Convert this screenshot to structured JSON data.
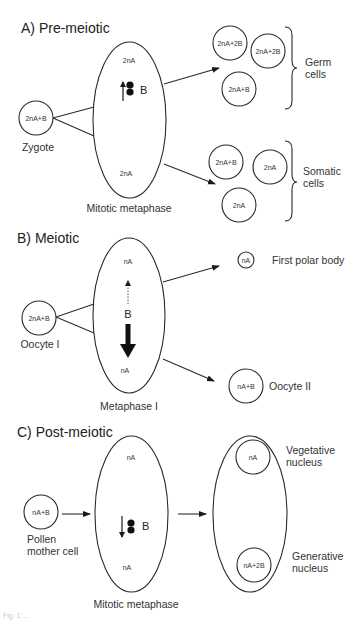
{
  "figure": {
    "sections": [
      {
        "id": "A",
        "title": "A)  Pre-meiotic",
        "start_cell": {
          "content": "2nA+B",
          "label": "Zygote"
        },
        "spindle": {
          "top": "2nA",
          "bottom": "2nA",
          "chromosome": "B",
          "movement": "up",
          "label": "Mitotic metaphase"
        },
        "outcomes": [
          {
            "group": "Germ cells",
            "group_lines": [
              "Germ",
              "cells"
            ],
            "cells": [
              "2nA+2B",
              "2nA+2B",
              "2nA+B"
            ]
          },
          {
            "group": "Somatic cells",
            "group_lines": [
              "Somatic",
              "cells"
            ],
            "cells": [
              "2nA+B",
              "2nA",
              "2nA"
            ]
          }
        ]
      },
      {
        "id": "B",
        "title": "B)  Meiotic",
        "start_cell": {
          "content": "2nA+B",
          "label": "Oocyte I"
        },
        "spindle": {
          "top": "nA",
          "bottom": "nA",
          "chromosome": "B",
          "movement": "down (preferential)",
          "label": "Metaphase I"
        },
        "outcomes": [
          {
            "cell": "nA",
            "label": "First polar body"
          },
          {
            "cell": "nA+B",
            "label": "Oocyte II"
          }
        ]
      },
      {
        "id": "C",
        "title": "C)  Post-meiotic",
        "start_cell": {
          "content": "nA+B",
          "label_lines": [
            "Pollen",
            "mother cell"
          ]
        },
        "spindle": {
          "top": "nA",
          "bottom": "nA",
          "chromosome": "B",
          "movement": "down",
          "label": "Mitotic metaphase"
        },
        "pollen": {
          "vegetative": {
            "content": "nA",
            "label_lines": [
              "Vegetative",
              "nucleus"
            ]
          },
          "generative": {
            "content": "nA+2B",
            "label_lines": [
              "Generative",
              "nucleus"
            ]
          }
        }
      }
    ],
    "caption_fragment": "Fig. 1 ..."
  },
  "colors": {
    "line": "#2a2a2a",
    "text": "#222222",
    "background": "#ffffff"
  }
}
